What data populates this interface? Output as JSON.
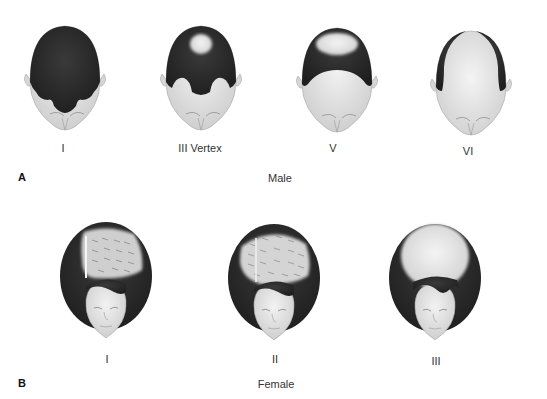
{
  "panel_a": {
    "letter": "A",
    "caption": "Male",
    "stages": [
      {
        "label": "I"
      },
      {
        "label": "III Vertex"
      },
      {
        "label": "V"
      },
      {
        "label": "VI"
      }
    ]
  },
  "panel_b": {
    "letter": "B",
    "caption": "Female",
    "stages": [
      {
        "label": "I"
      },
      {
        "label": "II"
      },
      {
        "label": "III"
      }
    ]
  },
  "colors": {
    "hair": "#2e2e2e",
    "skin": "#e6e6e6",
    "scalp_bald": "#dcdcdc",
    "background": "#ffffff"
  }
}
